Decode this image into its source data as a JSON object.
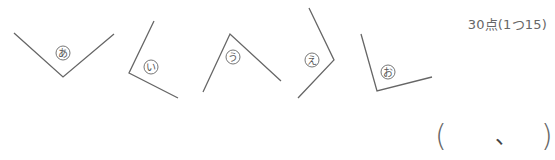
{
  "score": "30点(1つ15)",
  "angles": [
    {
      "label": "あ",
      "p1": [
        14,
        33
      ],
      "vertex": [
        63,
        77
      ],
      "p2": [
        114,
        34
      ],
      "label_pos": [
        63,
        53
      ]
    },
    {
      "label": "い",
      "p1": [
        154,
        21
      ],
      "vertex": [
        129,
        73
      ],
      "p2": [
        178,
        98
      ],
      "label_pos": [
        151,
        67
      ]
    },
    {
      "label": "う",
      "p1": [
        203,
        92
      ],
      "vertex": [
        230,
        34
      ],
      "p2": [
        281,
        81
      ],
      "label_pos": [
        233,
        57
      ]
    },
    {
      "label": "え",
      "p1": [
        309,
        8
      ],
      "vertex": [
        334,
        60
      ],
      "p2": [
        298,
        98
      ],
      "label_pos": [
        312,
        60
      ]
    },
    {
      "label": "お",
      "p1": [
        361,
        34
      ],
      "vertex": [
        377,
        91
      ],
      "p2": [
        432,
        77
      ],
      "label_pos": [
        388,
        72
      ]
    }
  ],
  "answer": {
    "open": "(",
    "separator": "、",
    "close": ")"
  },
  "colors": {
    "line": "#666666",
    "label_circle": "#666666"
  }
}
